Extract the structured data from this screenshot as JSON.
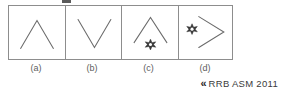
{
  "figure": {
    "type": "non-verbal-reasoning-option-set",
    "panel_count": 4,
    "stroke_color": "#6b6b6b",
    "border_color": "#8d8d8d",
    "panels": [
      {
        "label": "(a)",
        "shapes": [
          "chevron-up"
        ],
        "description": "An inverted V (chevron pointing up), centred in the box"
      },
      {
        "label": "(b)",
        "shapes": [
          "chevron-down"
        ],
        "description": "A V shape (chevron pointing down), centred in the box"
      },
      {
        "label": "(c)",
        "shapes": [
          "chevron-up",
          "six-pointed-star"
        ],
        "description": "An inverted V with a small six-pointed star below its apex"
      },
      {
        "label": "(d)",
        "shapes": [
          "chevron-right",
          "six-pointed-star"
        ],
        "description": "A chevron pointing right with a small six-pointed star to its left"
      }
    ]
  },
  "attribution": {
    "marker": "«",
    "source": "RRB ASM 2011"
  }
}
